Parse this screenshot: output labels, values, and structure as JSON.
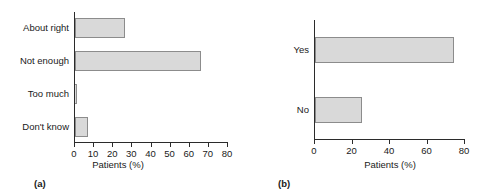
{
  "figure": {
    "panels": [
      {
        "panel_label": "(a)",
        "xlabel": "Patients (%)"
      },
      {
        "panel_label": "(b)",
        "xlabel": "Patients (%)"
      }
    ]
  },
  "chart_data": [
    {
      "type": "bar",
      "orientation": "horizontal",
      "title": "",
      "panel_label": "(a)",
      "categories": [
        "About right",
        "Not enough",
        "Too much",
        "Don't know"
      ],
      "values": [
        26,
        66,
        1,
        7
      ],
      "xlabel": "Patients (%)",
      "ylabel": "",
      "xlim": [
        0,
        80
      ],
      "xticks": [
        0,
        10,
        20,
        30,
        40,
        50,
        60,
        70,
        80
      ],
      "xtick_labels": [
        "0",
        "10",
        "20",
        "30",
        "40",
        "50",
        "60",
        "70",
        "80"
      ],
      "grid": false,
      "legend": null,
      "bar_fill": "#d9d9d9",
      "bar_edge": "#8c8c8c"
    },
    {
      "type": "bar",
      "orientation": "horizontal",
      "title": "",
      "panel_label": "(b)",
      "categories": [
        "Yes",
        "No"
      ],
      "values": [
        74,
        25
      ],
      "xlabel": "Patients (%)",
      "ylabel": "",
      "xlim": [
        0,
        80
      ],
      "xticks": [
        0,
        20,
        40,
        60,
        80
      ],
      "xtick_labels": [
        "0",
        "20",
        "40",
        "60",
        "80"
      ],
      "grid": false,
      "legend": null,
      "bar_fill": "#d9d9d9",
      "bar_edge": "#8c8c8c"
    }
  ]
}
